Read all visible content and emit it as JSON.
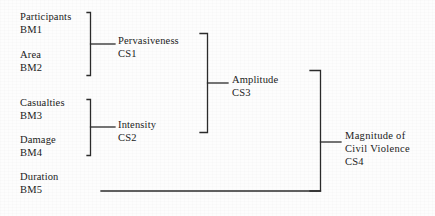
{
  "diagram": {
    "ink_color": "#2b2b2b",
    "background_color": "#fdfdfd",
    "indicators": [
      {
        "name": "Participants",
        "code": "BM1"
      },
      {
        "name": "Area",
        "code": "BM2"
      },
      {
        "name": "Casualties",
        "code": "BM3"
      },
      {
        "name": "Damage",
        "code": "BM4"
      },
      {
        "name": "Duration",
        "code": "BM5"
      }
    ],
    "constructs": [
      {
        "name": "Pervasiveness",
        "code": "CS1"
      },
      {
        "name": "Intensity",
        "code": "CS2"
      },
      {
        "name": "Amplitude",
        "code": "CS3"
      }
    ],
    "outcome": {
      "line1": "Magnitude of",
      "line2": "Civil Violence",
      "code": "CS4"
    }
  }
}
